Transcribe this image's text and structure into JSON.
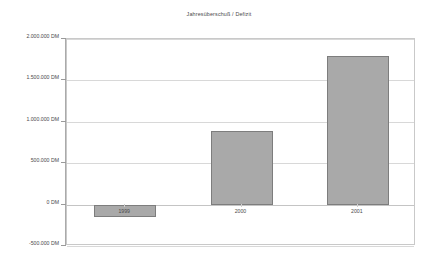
{
  "chart_data": {
    "type": "bar",
    "title": "Jahresüberschuß / Defizit",
    "xlabel": "",
    "ylabel": "",
    "categories": [
      "1999",
      "2000",
      "2001"
    ],
    "values": [
      -155000,
      890000,
      1790000
    ],
    "series": [
      {
        "name": "Jahresüberschuß / Defizit",
        "values": [
          -155000,
          890000,
          1790000
        ]
      }
    ],
    "ylim": [
      -500000,
      2000000
    ],
    "ytick_values": [
      2000000,
      1500000,
      1000000,
      500000,
      0,
      -500000
    ],
    "ytick_labels": [
      "2.000.000 DM",
      "1.500.000 DM",
      "1.000.000 DM",
      "500.000 DM",
      "0 DM",
      "-500.000 DM"
    ],
    "unit": "DM",
    "grid": true,
    "legend": false,
    "legend_position": "none",
    "bar_color": "#a9a9a9",
    "bar_border_color": "#7d7d7d",
    "gridline_color": "#d8d8d8",
    "axis_color": "#aaaaaa",
    "plot_border_color": "#c9c9c9",
    "background_color": "#ffffff",
    "text_color": "#4a4a4a"
  }
}
